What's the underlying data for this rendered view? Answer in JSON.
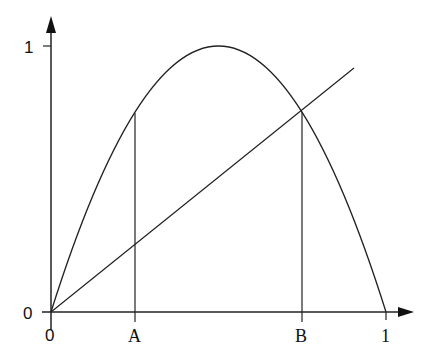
{
  "diagram": {
    "type": "function-plot",
    "axes": {
      "x_labels": {
        "origin": "0",
        "a": "A",
        "b": "B",
        "one": "1"
      },
      "y_labels": {
        "origin": "0",
        "one": "1"
      }
    },
    "curve": {
      "name": "parabola",
      "formula": "4x(1-x)",
      "peak": [
        0.5,
        1.0
      ]
    },
    "line": {
      "name": "diagonal",
      "formula": "y=x",
      "x_range": [
        0,
        0.9
      ]
    },
    "markers": [
      {
        "name": "A",
        "x": 0.25,
        "y": 0.75
      },
      {
        "name": "B",
        "x": 0.75,
        "y": 0.75
      }
    ],
    "colors": {
      "stroke": "#222222",
      "background": "#ffffff"
    }
  }
}
